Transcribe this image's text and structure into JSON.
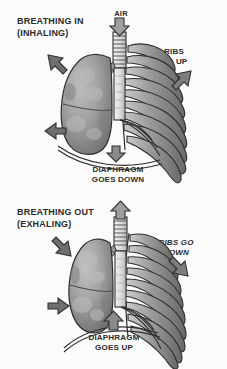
{
  "figure": {
    "background_color": "#fbfbfb",
    "ink_color": "#2b2b2b",
    "lung_fill": "#9a9a9a",
    "rib_fill": "#8d8d8d",
    "bone_fill": "#e2e2e2"
  },
  "panels": [
    {
      "id": "inhale",
      "heading_line1": "BREATHING IN",
      "heading_line2": "(INHALING)",
      "air_label": "AIR",
      "air_arrow_direction": "down",
      "ribs_label_line1": "RIBS",
      "ribs_label_line2": "GO UP",
      "ribs_arrow_direction": "up-right",
      "diaphragm_label_line1": "DIAPHRAGM",
      "diaphragm_label_line2": "GOES DOWN",
      "diaphragm_arrow_direction": "down",
      "lung_arrow_upper_direction": "up-left",
      "lung_arrow_lower_direction": "left"
    },
    {
      "id": "exhale",
      "heading_line1": "BREATHING OUT",
      "heading_line2": "(EXHALING)",
      "air_label": "",
      "air_arrow_direction": "up",
      "ribs_label_line1": "RIBS GO",
      "ribs_label_line2": "DOWN",
      "ribs_arrow_direction": "down-right",
      "diaphragm_label_line1": "DIAPHRAGM",
      "diaphragm_label_line2": "GOES UP",
      "diaphragm_arrow_direction": "up",
      "lung_arrow_upper_direction": "down-right",
      "lung_arrow_lower_direction": "right"
    }
  ]
}
